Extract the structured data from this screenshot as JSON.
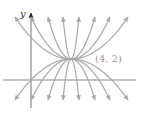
{
  "diagram": {
    "title": "",
    "point_label": "(4, 2)",
    "y_axis_label": "y",
    "point": {
      "x": 4,
      "y": 2
    },
    "colors": {
      "curves": "#a8a8a8",
      "axes": "#8a8a8a",
      "label": "#9a9a9a"
    },
    "curve_count_up": 8,
    "curve_count_down": 8
  }
}
